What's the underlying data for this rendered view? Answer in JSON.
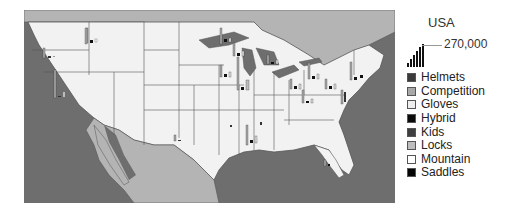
{
  "map": {
    "region": "USA",
    "colors": {
      "water": "#6e6e6e",
      "usa_land": "#f2f2f2",
      "foreign_land": "#b4b4b4",
      "borders": "#555555",
      "lakes": "#6e6e6e"
    }
  },
  "legend": {
    "title": "USA",
    "max_value": "270,000",
    "items": [
      {
        "label": "Helmets",
        "color": "#3a3a3a"
      },
      {
        "label": "Competition",
        "color": "#a8a8a8"
      },
      {
        "label": "Gloves",
        "color": "#eeeeee"
      },
      {
        "label": "Hybrid",
        "color": "#0a0a0a"
      },
      {
        "label": "Kids",
        "color": "#3e3e3e"
      },
      {
        "label": "Locks",
        "color": "#bdbdbd"
      },
      {
        "label": "Mountain",
        "color": "#ffffff"
      },
      {
        "label": "Saddles",
        "color": "#050505"
      }
    ]
  }
}
